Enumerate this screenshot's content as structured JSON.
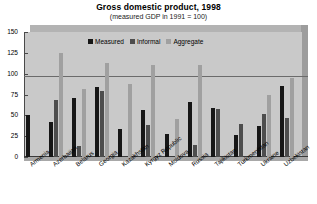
{
  "chart_data": {
    "type": "bar",
    "title": "Gross domestic product, 1998",
    "subtitle": "(measured GDP in 1991 = 100)",
    "xlabel": "",
    "ylabel": "",
    "ylim": [
      0,
      150
    ],
    "yticks": [
      0,
      25,
      50,
      75,
      100,
      125,
      150
    ],
    "grid": "reference line at 100",
    "legend_position": "top-center",
    "categories": [
      "Armenia",
      "Azerbaijan",
      "Belarus",
      "Georgia",
      "Kazakhstan",
      "Kyrgyz Republic",
      "Moldova",
      "Russia",
      "Tajikistan",
      "Turkmenistan",
      "Ukraine",
      "Uzbekistan"
    ],
    "series": [
      {
        "name": "Measured",
        "color": "#161616",
        "values": [
          50,
          42,
          71,
          84,
          34,
          57,
          28,
          66,
          59,
          27,
          37,
          85
        ]
      },
      {
        "name": "Informal",
        "color": "#4d4d4d",
        "values": [
          0,
          68,
          13,
          79,
          0,
          39,
          0,
          14,
          58,
          40,
          52,
          47
        ]
      },
      {
        "name": "Aggregate",
        "color": "#a0a0a0",
        "values": [
          0,
          125,
          82,
          113,
          88,
          111,
          46,
          110,
          0,
          0,
          74,
          95
        ]
      }
    ],
    "legend": [
      "Measured",
      "Informal",
      "Aggregate"
    ],
    "colors": {
      "measured": "#161616",
      "informal": "#4d4d4d",
      "aggregate": "#a0a0a0",
      "plot_background": "#c9c9c9",
      "page_background": "#ffffff"
    }
  },
  "axis": {
    "ytick_labels": [
      "150",
      "125",
      "100",
      "75",
      "50",
      "25",
      "0"
    ]
  }
}
